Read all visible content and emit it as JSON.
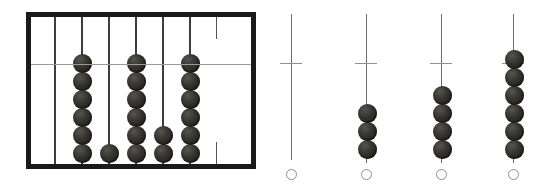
{
  "figure": {
    "background_color": "#ffffff",
    "bead_color": "#2b2a26",
    "frame_color": "#1a1a1a",
    "rod_color": "#3d3d3d",
    "crossbar_color": "#9a9a9a",
    "circle_outline_color": "#8d8d8d"
  },
  "abacus": {
    "label": "framed abacus",
    "frame": {
      "x": 26,
      "y": 12,
      "width": 230,
      "height": 157,
      "border_width": 5
    },
    "crossbar": {
      "y": 64,
      "x_start": 31,
      "x_end": 251
    },
    "rod_count": 7,
    "stub_rod_count": 1,
    "bead_diameter": 19,
    "rods": [
      {
        "index": 1,
        "x": 54,
        "bead_count": 0,
        "beads_above_crossbar": 0,
        "type": "full"
      },
      {
        "index": 2,
        "x": 81,
        "bead_count": 6,
        "beads_above_crossbar": 1,
        "type": "full"
      },
      {
        "index": 3,
        "x": 108,
        "bead_count": 1,
        "beads_above_crossbar": 0,
        "type": "full"
      },
      {
        "index": 4,
        "x": 135,
        "bead_count": 6,
        "beads_above_crossbar": 1,
        "type": "full"
      },
      {
        "index": 5,
        "x": 162,
        "bead_count": 2,
        "beads_above_crossbar": 0,
        "type": "full"
      },
      {
        "index": 6,
        "x": 189,
        "bead_count": 6,
        "beads_above_crossbar": 1,
        "type": "full"
      },
      {
        "index": 7,
        "x": 216,
        "bead_count": 0,
        "beads_above_crossbar": 0,
        "type": "stub"
      }
    ]
  },
  "free_rods": [
    {
      "index": 1,
      "x": 291,
      "top": 14,
      "bottom": 160,
      "bead_count": 0,
      "beads_above_tick": 0,
      "tick_y": 63,
      "marker": "hollow-circle",
      "marker_y": 169
    },
    {
      "index": 2,
      "x": 366,
      "top": 14,
      "bottom": 163,
      "bead_count": 3,
      "beads_above_tick": 0,
      "tick_y": 63,
      "marker": "hollow-circle",
      "marker_y": 169
    },
    {
      "index": 3,
      "x": 441,
      "top": 14,
      "bottom": 163,
      "bead_count": 4,
      "beads_above_tick": 0,
      "tick_y": 63,
      "marker": "hollow-circle",
      "marker_y": 169
    },
    {
      "index": 4,
      "x": 513,
      "top": 14,
      "bottom": 163,
      "bead_count": 6,
      "beads_above_tick": 1,
      "tick_y": 63,
      "marker": "hollow-circle",
      "marker_y": 169
    }
  ]
}
